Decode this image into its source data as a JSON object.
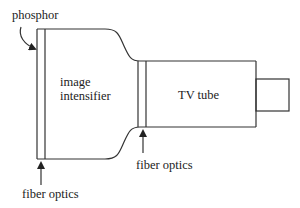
{
  "diagram": {
    "type": "schematic",
    "labels": {
      "phosphor": "phosphor",
      "image_intensifier_line1": "image",
      "image_intensifier_line2": "intensifier",
      "tv_tube": "TV tube",
      "fiber_optics_left": "fiber optics",
      "fiber_optics_right": "fiber optics"
    },
    "components": [
      {
        "name": "phosphor",
        "kind": "curved-arrow-label"
      },
      {
        "name": "image intensifier",
        "kind": "housing"
      },
      {
        "name": "fiber optics (input)",
        "kind": "plate"
      },
      {
        "name": "fiber optics (coupling)",
        "kind": "plate"
      },
      {
        "name": "TV tube",
        "kind": "box"
      },
      {
        "name": "connector",
        "kind": "box"
      }
    ],
    "colors": {
      "line": "#333333",
      "background": "#ffffff"
    }
  }
}
